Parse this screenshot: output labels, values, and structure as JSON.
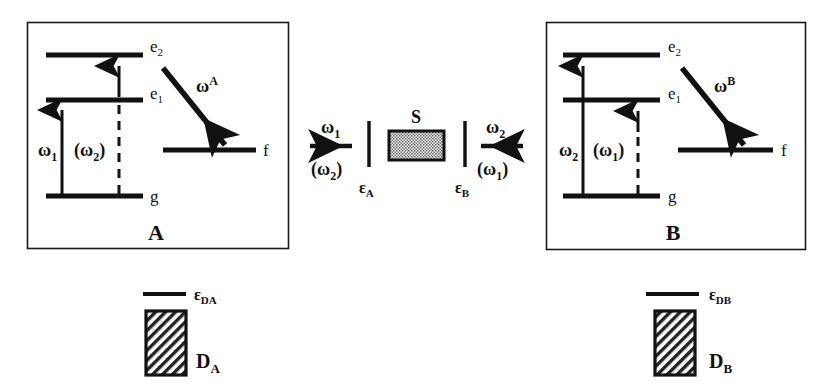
{
  "figure": {
    "background_color": "#ffffff",
    "ink_color": "#111111",
    "width": 827,
    "height": 388
  },
  "panel_a": {
    "panel_label": "A",
    "levels": [
      {
        "id": "e2",
        "label": "e",
        "sub": "2"
      },
      {
        "id": "e1",
        "label": "e",
        "sub": "1"
      },
      {
        "id": "f",
        "label": "f",
        "sub": ""
      },
      {
        "id": "g",
        "label": "g",
        "sub": ""
      }
    ],
    "transitions": [
      {
        "id": "omega1",
        "label": "ω",
        "sub": "1",
        "sup": "",
        "style": "solid",
        "from": "g",
        "to": "e1",
        "note": "absorption g to e1"
      },
      {
        "id": "omega2p",
        "label": "(ω",
        "sub": "2",
        "sup": "",
        "close": ")",
        "style": "dashed",
        "from": "g",
        "to": "e1",
        "note": "alternate absorption, parenthesized"
      },
      {
        "id": "omega_up_e2",
        "label": "",
        "sub": "",
        "sup": "",
        "style": "solid",
        "from": "e1",
        "to": "e2",
        "note": "short upward arrow e1 to e2"
      },
      {
        "id": "omegaA",
        "label": "ω",
        "sub": "",
        "sup": "A",
        "style": "thick-diagonal",
        "from": "e2",
        "to": "f",
        "note": "emitted photon omega superscript A"
      }
    ]
  },
  "panel_b": {
    "panel_label": "B",
    "levels": [
      {
        "id": "e2",
        "label": "e",
        "sub": "2"
      },
      {
        "id": "e1",
        "label": "e",
        "sub": "1"
      },
      {
        "id": "f",
        "label": "f",
        "sub": ""
      },
      {
        "id": "g",
        "label": "g",
        "sub": ""
      }
    ],
    "transitions": [
      {
        "id": "omega2",
        "label": "ω",
        "sub": "2",
        "sup": "",
        "style": "solid",
        "from": "g",
        "to": "e2",
        "note": "absorption g to e2"
      },
      {
        "id": "omega1p",
        "label": "(ω",
        "sub": "1",
        "sup": "",
        "close": ")",
        "style": "dashed",
        "from": "g",
        "to": "e1",
        "note": "alternate absorption, parenthesized"
      },
      {
        "id": "omegaB",
        "label": "ω",
        "sub": "",
        "sup": "B",
        "style": "thick-diagonal",
        "from": "e2",
        "to": "f",
        "note": "emitted photon omega superscript B"
      }
    ]
  },
  "source": {
    "label": "S",
    "left_beam": {
      "primary": "ω",
      "primary_sub": "1",
      "alternate_open": "(ω",
      "alternate_sub": "2",
      "alternate_close": ")",
      "direction": "left"
    },
    "right_beam": {
      "primary": "ω",
      "primary_sub": "2",
      "alternate_open": "(ω",
      "alternate_sub": "1",
      "alternate_close": ")",
      "direction": "right"
    },
    "aperture_left": {
      "label": "ε",
      "sub": "A"
    },
    "aperture_right": {
      "label": "ε",
      "sub": "B"
    }
  },
  "detectors": [
    {
      "id": "da",
      "slit_label": "ε",
      "slit_sub": "DA",
      "box_label": "D",
      "box_sub": "A"
    },
    {
      "id": "db",
      "slit_label": "ε",
      "slit_sub": "DB",
      "box_label": "D",
      "box_sub": "B"
    }
  ]
}
